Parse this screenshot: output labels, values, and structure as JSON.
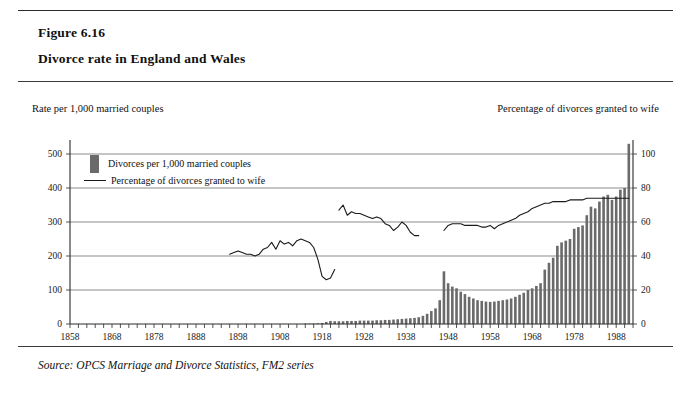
{
  "figure": {
    "number": "Figure 6.16",
    "title": "Divorce rate in England and Wales",
    "source": "Source: OPCS Marriage and Divorce Statistics, FM2 series"
  },
  "captions": {
    "left": "Rate per 1,000 married couples",
    "right": "Percentage of divorces granted to wife"
  },
  "legend": {
    "bar_label": "Divorces per 1,000 married couples",
    "line_label": "Percentage of divorces granted to wife"
  },
  "colors": {
    "bar_fill": "#6a6a6a",
    "line_stroke": "#1a1a1a",
    "gridline": "#5a5a5a",
    "axis": "#2a2a2a",
    "page_background": "#ffffff"
  },
  "chart_data": {
    "type": "bar",
    "title": "Divorce rate in England and Wales",
    "subtitle": "Figure 6.16",
    "xlabel": "",
    "ylabel": "Rate per 1,000 married couples",
    "y2label": "Percentage of divorces granted to wife",
    "xlim": [
      1858,
      1992
    ],
    "ylim": [
      0,
      500
    ],
    "y2lim": [
      0,
      100
    ],
    "yticks": [
      0,
      100,
      200,
      300,
      400,
      500
    ],
    "y2ticks": [
      0,
      20,
      40,
      60,
      80,
      100
    ],
    "xticks": [
      1858,
      1868,
      1878,
      1888,
      1898,
      1908,
      1918,
      1928,
      1938,
      1948,
      1958,
      1968,
      1978,
      1988
    ],
    "xtick_minor_interval": 2,
    "grid": "horizontal",
    "legend_position": "inside-upper-left",
    "series": [
      {
        "name": "Divorces per 1,000 married couples",
        "type": "bar",
        "axis": "left",
        "x": [
          1858,
          1859,
          1860,
          1861,
          1862,
          1863,
          1864,
          1865,
          1866,
          1867,
          1868,
          1869,
          1870,
          1871,
          1872,
          1873,
          1874,
          1875,
          1876,
          1877,
          1878,
          1879,
          1880,
          1881,
          1882,
          1883,
          1884,
          1885,
          1886,
          1887,
          1888,
          1889,
          1890,
          1891,
          1892,
          1893,
          1894,
          1895,
          1896,
          1897,
          1898,
          1899,
          1900,
          1901,
          1902,
          1903,
          1904,
          1905,
          1906,
          1907,
          1908,
          1909,
          1910,
          1911,
          1912,
          1913,
          1914,
          1915,
          1916,
          1917,
          1918,
          1919,
          1920,
          1921,
          1922,
          1923,
          1924,
          1925,
          1926,
          1927,
          1928,
          1929,
          1930,
          1931,
          1932,
          1933,
          1934,
          1935,
          1936,
          1937,
          1938,
          1939,
          1940,
          1941,
          1942,
          1943,
          1944,
          1945,
          1946,
          1947,
          1948,
          1949,
          1950,
          1951,
          1952,
          1953,
          1954,
          1955,
          1956,
          1957,
          1958,
          1959,
          1960,
          1961,
          1962,
          1963,
          1964,
          1965,
          1966,
          1967,
          1968,
          1969,
          1970,
          1971,
          1972,
          1973,
          1974,
          1975,
          1976,
          1977,
          1978,
          1979,
          1980,
          1981,
          1982,
          1983,
          1984,
          1985,
          1986,
          1987,
          1988,
          1989,
          1990,
          1991
        ],
        "values": [
          0,
          0,
          0,
          0,
          0,
          0,
          0,
          0,
          0,
          0,
          0,
          0,
          0,
          0,
          0,
          0,
          0,
          0,
          0,
          0,
          0,
          0,
          0,
          0,
          0,
          0,
          0,
          0,
          0,
          0,
          0,
          0,
          0,
          0,
          0,
          0,
          0,
          0,
          0,
          0,
          0,
          0,
          0,
          0,
          0,
          0,
          0,
          0,
          0,
          0,
          0,
          0,
          0,
          0,
          0,
          0,
          1,
          1,
          1,
          2,
          3,
          6,
          9,
          8,
          8,
          8,
          9,
          9,
          9,
          10,
          10,
          10,
          10,
          11,
          11,
          12,
          12,
          13,
          14,
          15,
          16,
          17,
          18,
          20,
          24,
          30,
          38,
          46,
          70,
          155,
          120,
          110,
          105,
          95,
          88,
          80,
          75,
          70,
          68,
          66,
          65,
          66,
          68,
          70,
          72,
          75,
          80,
          86,
          92,
          100,
          105,
          112,
          120,
          160,
          180,
          195,
          230,
          240,
          245,
          250,
          280,
          285,
          290,
          320,
          345,
          340,
          360,
          375,
          380,
          365,
          375,
          395,
          400,
          530
        ]
      },
      {
        "name": "Percentage of divorces granted to wife",
        "type": "line",
        "axis": "right",
        "segments": [
          {
            "x": [
              1896,
              1897,
              1898,
              1899,
              1900,
              1901,
              1902,
              1903,
              1904,
              1905,
              1906,
              1907,
              1908,
              1909,
              1910,
              1911,
              1912,
              1913,
              1914,
              1915,
              1916,
              1917,
              1918,
              1919,
              1920,
              1921
            ],
            "values": [
              41,
              42,
              43,
              42,
              41,
              41,
              40,
              41,
              44,
              45,
              48,
              44,
              49,
              47,
              48,
              46,
              49,
              50,
              49,
              48,
              45,
              38,
              28,
              26,
              27,
              32
            ]
          },
          {
            "x": [
              1922,
              1923,
              1924,
              1925,
              1926,
              1927,
              1928,
              1929,
              1930,
              1931,
              1932,
              1933,
              1934,
              1935,
              1936,
              1937,
              1938,
              1939,
              1940,
              1941
            ],
            "values": [
              67,
              70,
              64,
              66,
              65,
              65,
              64,
              63,
              62,
              63,
              62,
              59,
              58,
              55,
              57,
              60,
              58,
              54,
              52,
              52
            ]
          },
          {
            "x": [
              1947,
              1948,
              1949,
              1950,
              1951,
              1952,
              1953,
              1954,
              1955,
              1956,
              1957,
              1958,
              1959,
              1960,
              1961,
              1962,
              1963,
              1964,
              1965,
              1966,
              1967,
              1968,
              1969,
              1970,
              1971,
              1972,
              1973,
              1974,
              1975,
              1976,
              1977,
              1978,
              1979,
              1980,
              1981,
              1982,
              1983,
              1984,
              1985,
              1986,
              1987,
              1988,
              1989,
              1990,
              1991
            ],
            "values": [
              55,
              58,
              59,
              59,
              59,
              58,
              58,
              58,
              58,
              57,
              57,
              58,
              56,
              58,
              59,
              60,
              61,
              62,
              64,
              65,
              66,
              68,
              69,
              70,
              71,
              71,
              72,
              72,
              72,
              72,
              73,
              73,
              73,
              73,
              74,
              74,
              74,
              74,
              74,
              74,
              74,
              74,
              74,
              74,
              74
            ]
          }
        ]
      }
    ]
  }
}
